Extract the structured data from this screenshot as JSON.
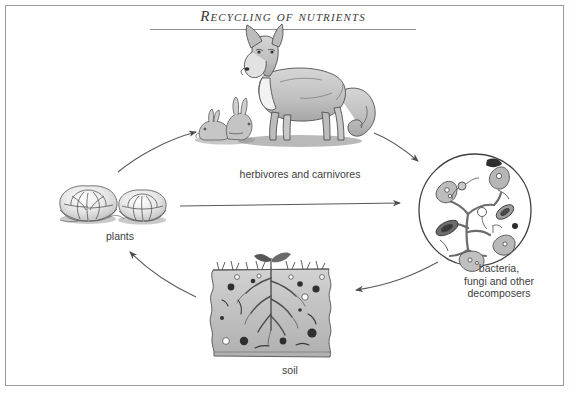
{
  "page": {
    "background": "#ffffff",
    "frame_color": "#9a9a9a",
    "ink_color": "#3d3d3d"
  },
  "title": {
    "text": "Recycling of nutrients",
    "style": "italic small-caps serif",
    "rule": true
  },
  "diagram": {
    "type": "cycle",
    "direction": "clockwise",
    "nodes": [
      {
        "id": "plants",
        "label": "plants",
        "illustration": "two-leafy-plants",
        "position": "left"
      },
      {
        "id": "animals",
        "label": "herbivores and carnivores",
        "illustration": "fox-and-two-rabbits",
        "position": "top"
      },
      {
        "id": "microbes",
        "label": "bacteria,\nfungi and other\ndecomposers",
        "illustration": "microscope-circle-with-bacteria-and-fungi",
        "position": "right"
      },
      {
        "id": "soil",
        "label": "soil",
        "illustration": "soil-block-with-seedling-and-roots",
        "position": "bottom"
      }
    ],
    "arrows": [
      {
        "id": "plants-to-animals",
        "from": "plants",
        "to": "animals",
        "shape": "curved"
      },
      {
        "id": "animals-to-microbes",
        "from": "animals",
        "to": "microbes",
        "shape": "curved"
      },
      {
        "id": "plants-to-microbes",
        "from": "plants",
        "to": "microbes",
        "shape": "straight"
      },
      {
        "id": "microbes-to-soil",
        "from": "microbes",
        "to": "soil",
        "shape": "curved"
      },
      {
        "id": "soil-to-plants",
        "from": "soil",
        "to": "plants",
        "shape": "curved"
      }
    ]
  },
  "colors": {
    "ink": "#3d3d3d",
    "arrow": "#555555",
    "wash_light": "#d9d9d9",
    "wash_mid": "#b4b4b4",
    "wash_dark": "#8a8a8a",
    "outline": "#4a4a4a"
  }
}
